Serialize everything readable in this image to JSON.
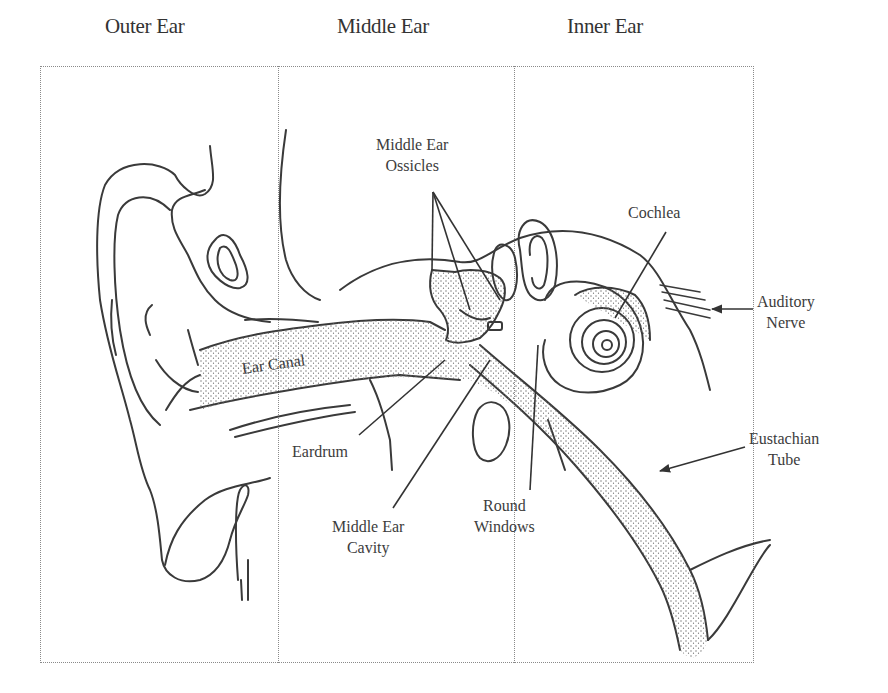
{
  "diagram": {
    "sections": [
      {
        "id": "outer",
        "title": "Outer Ear"
      },
      {
        "id": "middle",
        "title": "Middle Ear"
      },
      {
        "id": "inner",
        "title": "Inner Ear"
      }
    ],
    "labels": {
      "ossicles": {
        "line1": "Middle Ear",
        "line2": "Ossicles"
      },
      "cochlea": {
        "line1": "Cochlea"
      },
      "auditory_nerve": {
        "line1": "Auditory",
        "line2": "Nerve"
      },
      "ear_canal": {
        "line1": "Ear Canal"
      },
      "eardrum": {
        "line1": "Eardrum"
      },
      "eustachian_tube": {
        "line1": "Eustachian",
        "line2": "Tube"
      },
      "round_windows": {
        "line1": "Round",
        "line2": "Windows"
      },
      "middle_ear_cavity": {
        "line1": "Middle Ear",
        "line2": "Cavity"
      }
    },
    "colors": {
      "ink": "#3a3a3a",
      "frame": "#8a8a8a",
      "stipple": "#6a6a6a",
      "background": "#ffffff"
    }
  }
}
